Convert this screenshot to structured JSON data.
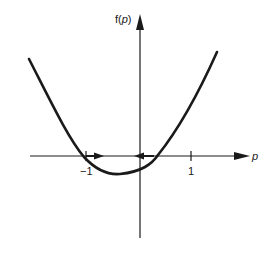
{
  "diagram": {
    "type": "function-plot",
    "y_axis_label": "f(p)",
    "y_axis_label_prefix": "f(",
    "y_axis_label_var": "p",
    "y_axis_label_suffix": ")",
    "x_axis_label": "p",
    "x_ticks": [
      {
        "value": -1,
        "label": "−1"
      },
      {
        "value": 1,
        "label": "1"
      }
    ],
    "curve": {
      "shape": "parabola",
      "roots_approx": [
        -1.0,
        0.18
      ],
      "minimum_approx": {
        "p": -0.4,
        "f": "below axis"
      }
    },
    "flow_arrows": [
      {
        "position": "right of root -1",
        "direction": "right"
      },
      {
        "position": "at origin",
        "direction": "left"
      }
    ],
    "colors": {
      "ink": "#1a1a1a",
      "background": "#ffffff"
    }
  }
}
